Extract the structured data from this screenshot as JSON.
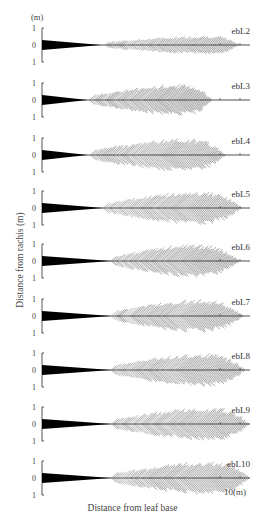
{
  "chart_data": {
    "type": "line",
    "title": "",
    "xlabel": "Distance from leaf base",
    "ylabel": "Distance from rachis (m)",
    "y_unit": "(m)",
    "x_unit_label": "10(m)",
    "xlim": [
      0,
      10.5
    ],
    "ylim": [
      -1,
      1
    ],
    "y_ticks": [
      "1",
      "0",
      "1"
    ],
    "x_ticks": [
      9,
      10
    ],
    "grid": false,
    "legend": "none",
    "panels": [
      {
        "name": "ebL2",
        "petiole_end": 3.0,
        "leaflet_start": 3.2,
        "leaflet_end": 10.0,
        "max_width": 0.5,
        "peak_at": 8.0
      },
      {
        "name": "ebL3",
        "petiole_end": 2.3,
        "leaflet_start": 2.4,
        "leaflet_end": 8.6,
        "max_width": 0.85,
        "peak_at": 6.2
      },
      {
        "name": "ebL4",
        "petiole_end": 2.3,
        "leaflet_start": 2.4,
        "leaflet_end": 9.3,
        "max_width": 0.9,
        "peak_at": 6.4
      },
      {
        "name": "ebL5",
        "petiole_end": 3.1,
        "leaflet_start": 3.1,
        "leaflet_end": 10.1,
        "max_width": 0.9,
        "peak_at": 7.0
      },
      {
        "name": "ebL6",
        "petiole_end": 3.5,
        "leaflet_start": 3.5,
        "leaflet_end": 10.0,
        "max_width": 0.9,
        "peak_at": 6.8
      },
      {
        "name": "ebL7",
        "petiole_end": 3.5,
        "leaflet_start": 3.5,
        "leaflet_end": 10.2,
        "max_width": 0.9,
        "peak_at": 7.0
      },
      {
        "name": "ebL8",
        "petiole_end": 3.5,
        "leaflet_start": 3.5,
        "leaflet_end": 10.3,
        "max_width": 0.9,
        "peak_at": 7.2
      },
      {
        "name": "ebL9",
        "petiole_end": 3.5,
        "leaflet_start": 3.5,
        "leaflet_end": 10.5,
        "max_width": 0.9,
        "peak_at": 7.6
      },
      {
        "name": "ebL10",
        "petiole_end": 3.5,
        "leaflet_start": 3.5,
        "leaflet_end": 10.5,
        "max_width": 0.9,
        "peak_at": 7.6
      }
    ]
  }
}
